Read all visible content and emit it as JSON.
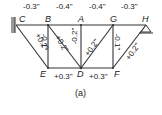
{
  "nodes": {
    "C": "C",
    "B": "B",
    "A": "A",
    "G": "G",
    "H": "H",
    "E": "E",
    "D": "D",
    "F": "F"
  },
  "top_chord": [
    "-0.3\"",
    "-0.4\"",
    "-0.4\"",
    "-0.3\""
  ],
  "verticals": {
    "BE": "-0.1\"",
    "AD": "-0.2\"",
    "GF": "-0.1\""
  },
  "diagonals": {
    "CE": "+0.2\"",
    "BD": "+0.2\"",
    "DG": "+0.2\"",
    "FH": "+0.2\""
  },
  "bottom_chord": [
    "+0.3\"",
    "+0.3\""
  ],
  "caption": "(a)"
}
